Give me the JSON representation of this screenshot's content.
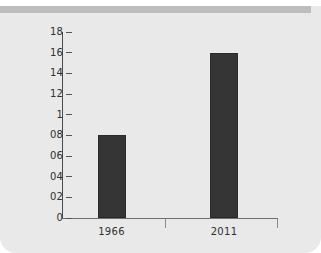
{
  "chart_data": {
    "type": "bar",
    "title": "",
    "subtitle": "",
    "xlabel": "",
    "ylabel": "",
    "categories": [
      "1966",
      "2011"
    ],
    "values": [
      0.8,
      1.6
    ],
    "value_labels": [
      "08",
      "16"
    ],
    "ylim": [
      0,
      1.8
    ],
    "y_ticks": [
      0,
      0.2,
      0.4,
      0.6,
      0.8,
      1.0,
      1.2,
      1.4,
      1.6,
      1.8
    ],
    "y_tick_labels": [
      "0",
      "02",
      "04",
      "06",
      "08",
      "1",
      "12",
      "14",
      "16",
      "18"
    ],
    "grid": false,
    "legend": null,
    "legend_position": "none",
    "series": [
      {
        "name": "",
        "values": [
          0.8,
          1.6
        ]
      }
    ],
    "annotations": []
  },
  "style": {
    "bar_color": "#353535",
    "bar_border_color": "#2a2a2a",
    "card_background": "#e9e9e9",
    "page_background": "#ffffff",
    "top_band_color": "#bdbdbd",
    "axis_color": "#4a4a4a",
    "x_axis_color": "#6e6e6e",
    "tick_color": "#555555",
    "text_color": "#2f2f2f"
  }
}
